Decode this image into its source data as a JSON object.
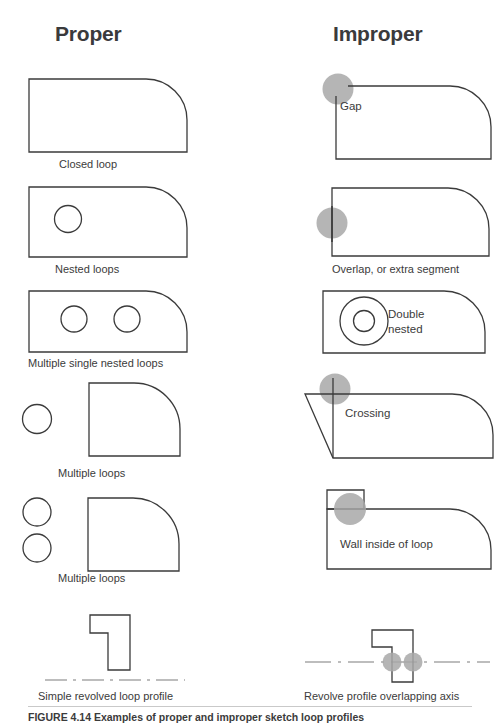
{
  "figure": {
    "headings": {
      "proper": "Proper",
      "improper": "Improper"
    },
    "caption": "FIGURE 4.14  Examples of proper and improper sketch loop profiles",
    "colors": {
      "stroke": "#3b3b3b",
      "highlight": "#a8a8a8",
      "text": "#3b3b3b",
      "heading": "#3a3a3c",
      "rule": "#c9c9c9",
      "background": "#ffffff"
    }
  },
  "proper": [
    {
      "id": "closed-loop",
      "caption": "Closed loop",
      "shape": "rounded-corner-rect",
      "loops": 1,
      "annotations": []
    },
    {
      "id": "nested-loops",
      "caption": "Nested loops",
      "shape": "rounded-corner-rect-with-circle",
      "loops": 2,
      "annotations": []
    },
    {
      "id": "multiple-single-nested-loops",
      "caption": "Multiple single nested loops",
      "shape": "rounded-corner-rect-with-two-circles",
      "loops": 3,
      "annotations": []
    },
    {
      "id": "multiple-loops-one-circle",
      "caption": "Multiple loops",
      "shape": "separate-circle-and-rounded-rect",
      "loops": 2,
      "annotations": []
    },
    {
      "id": "multiple-loops-two-circles",
      "caption": "Multiple loops",
      "shape": "two-separate-circles-and-rounded-rect",
      "loops": 3,
      "annotations": []
    },
    {
      "id": "simple-revolved-loop-profile",
      "caption": "Simple revolved loop profile",
      "shape": "l-profile-above-axis",
      "loops": 1,
      "annotations": []
    }
  ],
  "improper": [
    {
      "id": "gap",
      "caption": "",
      "inline_label": "Gap",
      "shape": "rounded-corner-rect-open-corner",
      "defect": "gap",
      "marker_count": 1
    },
    {
      "id": "overlap-extra-segment",
      "caption": "Overlap, or extra segment",
      "inline_label": "",
      "shape": "rounded-corner-rect-overlapping-edge",
      "defect": "overlap",
      "marker_count": 1
    },
    {
      "id": "double-nested",
      "caption": "",
      "inline_label": "Double\nnested",
      "inline_label_line1": "Double",
      "inline_label_line2": "nested",
      "shape": "rounded-corner-rect-with-concentric-circles",
      "defect": "double-nested",
      "marker_count": 0
    },
    {
      "id": "crossing",
      "caption": "",
      "inline_label": "Crossing",
      "shape": "rounded-corner-rect-crossing-lines",
      "defect": "crossing",
      "marker_count": 1
    },
    {
      "id": "wall-inside-of-loop",
      "caption": "",
      "inline_label": "Wall inside of loop",
      "shape": "rounded-corner-rect-with-interior-wall-box",
      "defect": "wall-inside",
      "marker_count": 1
    },
    {
      "id": "revolve-profile-overlapping-axis",
      "caption": "Revolve profile overlapping axis",
      "inline_label": "",
      "shape": "l-profile-crossing-axis",
      "defect": "overlapping-axis",
      "marker_count": 2
    }
  ]
}
